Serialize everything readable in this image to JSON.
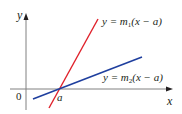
{
  "diagram": {
    "type": "graph-two-lines",
    "axes": {
      "x_label": "x",
      "y_label": "y",
      "origin_label": "0",
      "axis_color": "#808080"
    },
    "point": {
      "label": "a"
    },
    "lines": [
      {
        "name": "line-1",
        "equation_prefix": "y = m",
        "subscript": "1",
        "equation_suffix": "(x − a)",
        "color": "#e0202a"
      },
      {
        "name": "line-2",
        "equation_prefix": "y = m",
        "subscript": "2",
        "equation_suffix": "(x − a)",
        "color": "#1f3f9e"
      }
    ]
  }
}
